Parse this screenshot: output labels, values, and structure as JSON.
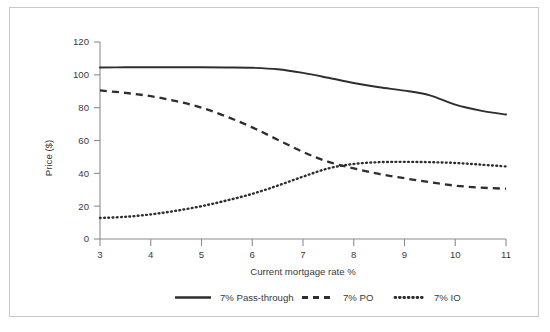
{
  "chart_data": {
    "type": "line",
    "title": "",
    "xlabel": "Current mortgage rate %",
    "ylabel": "Price ($)",
    "xlim": [
      3,
      11
    ],
    "ylim": [
      0,
      120
    ],
    "xticks": [
      "3",
      "4",
      "5",
      "6",
      "7",
      "8",
      "9",
      "10",
      "11"
    ],
    "yticks": [
      "0",
      "20",
      "40",
      "60",
      "80",
      "100",
      "120"
    ],
    "grid": false,
    "legend_position": "bottom",
    "x": [
      3,
      3.5,
      4,
      4.5,
      5,
      5.5,
      6,
      6.5,
      7,
      7.5,
      8,
      8.5,
      9,
      9.5,
      10,
      10.5,
      11
    ],
    "series": [
      {
        "name": "7% Pass-through",
        "style": "solid",
        "color": "#2e2e2e",
        "values": [
          104.5,
          104.6,
          104.6,
          104.6,
          104.6,
          104.5,
          104.3,
          103.4,
          101.2,
          98.2,
          95.0,
          92.4,
          90.4,
          87.5,
          81.8,
          78.2,
          75.8
        ]
      },
      {
        "name": "7% PO",
        "style": "dashed",
        "color": "#2e2e2e",
        "values": [
          90.5,
          89.0,
          87.0,
          84.0,
          80.0,
          74.5,
          68.0,
          60.5,
          53.0,
          47.0,
          43.0,
          39.6,
          37.0,
          34.6,
          32.5,
          31.3,
          30.6
        ]
      },
      {
        "name": "7% IO",
        "style": "dotted",
        "color": "#2e2e2e",
        "values": [
          12.8,
          13.5,
          15.0,
          17.2,
          20.0,
          23.5,
          27.5,
          32.5,
          38.0,
          43.0,
          45.7,
          46.8,
          47.0,
          46.8,
          46.3,
          45.3,
          44.2
        ]
      }
    ],
    "annotations": []
  },
  "legend": {
    "items": [
      {
        "label": "7% Pass-through",
        "style": "solid"
      },
      {
        "label": "7% PO",
        "style": "dashed"
      },
      {
        "label": "7% IO",
        "style": "dotted"
      }
    ]
  },
  "colors": {
    "frame": "#c8c8c8",
    "axis": "#8c8c8c",
    "ink": "#2e2e2e",
    "text": "#3a3a3a",
    "background": "#ffffff"
  }
}
